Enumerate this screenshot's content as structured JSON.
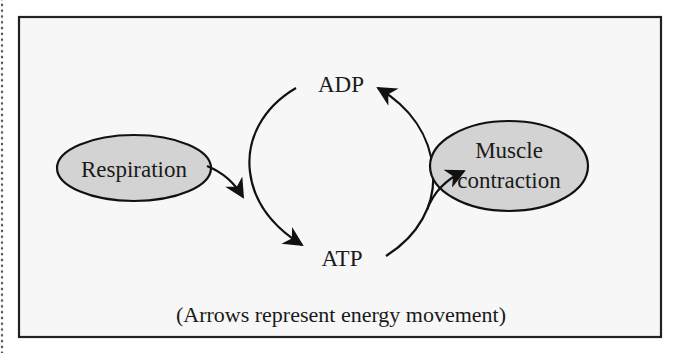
{
  "diagram": {
    "nodes": {
      "adp": {
        "label": "ADP"
      },
      "atp": {
        "label": "ATP"
      },
      "respiration": {
        "label": "Respiration"
      },
      "muscle": {
        "line1": "Muscle",
        "line2": "contraction"
      }
    },
    "caption": "(Arrows represent energy movement)",
    "edges": [
      {
        "from": "Respiration",
        "to": "ATP cycle"
      },
      {
        "from": "ADP",
        "to": "ATP"
      },
      {
        "from": "ATP",
        "to": "ADP"
      },
      {
        "from": "ATP cycle",
        "to": "Muscle contraction"
      }
    ]
  },
  "colors": {
    "panel_bg": "#f7f7f7",
    "border": "#222222",
    "ellipse_fill": "#d3d3d3",
    "stroke": "#111111"
  }
}
